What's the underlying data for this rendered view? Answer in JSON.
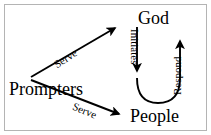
{
  "figure": {
    "type": "cycle-diagram",
    "background_color": "#ffffff",
    "stroke_color": "#000000",
    "border_color": "#b4b4b4",
    "nodes": [
      {
        "id": "god",
        "label": "God"
      },
      {
        "id": "people",
        "label": "People"
      },
      {
        "id": "prompters",
        "label": "Prompters"
      }
    ],
    "edges": [
      {
        "id": "initiates",
        "label": "Initiates",
        "from": "god",
        "to": "people",
        "orientation": "vertical-down"
      },
      {
        "id": "respond",
        "label": "Respond",
        "from": "people",
        "to": "god",
        "orientation": "vertical-up"
      },
      {
        "id": "serve-top",
        "label": "Serve",
        "from": "prompters",
        "to": "god",
        "orientation": "diagonal-up-right"
      },
      {
        "id": "serve-bottom",
        "label": "Serve",
        "from": "prompters",
        "to": "people",
        "orientation": "diagonal-down-right"
      }
    ]
  }
}
